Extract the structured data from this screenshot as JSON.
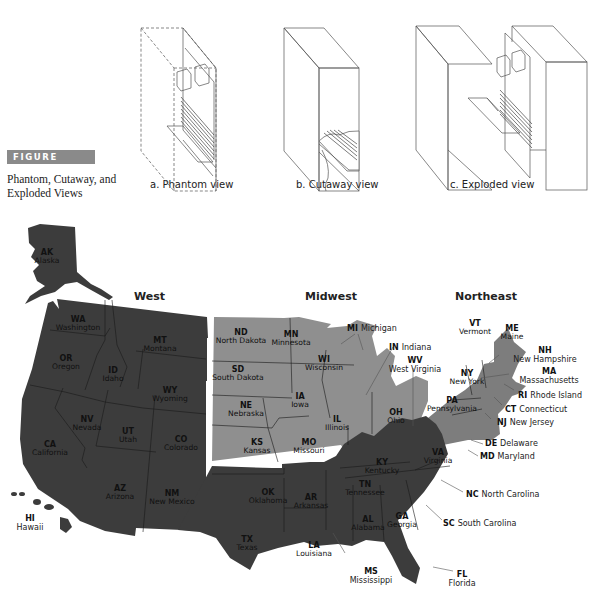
{
  "figure": {
    "badge": "FIGURE 12.40",
    "caption_line1": "Phantom, Cutaway, and",
    "caption_line2": "Exploded Views",
    "badge_color": "#8a8a8a"
  },
  "views": [
    {
      "label": "a. Phantom view"
    },
    {
      "label": "b. Cutaway view"
    },
    {
      "label": "c. Exploded view"
    }
  ],
  "map": {
    "colors": {
      "dark_regions": "#3c3c3c",
      "midwest": "#8f8f8f",
      "northeast": "#7d7d7d",
      "background": "#ffffff"
    },
    "regions": [
      {
        "name": "West"
      },
      {
        "name": "Midwest"
      },
      {
        "name": "Northeast"
      }
    ],
    "states_inside": [
      {
        "abbr": "AK",
        "name": "Alaska"
      },
      {
        "abbr": "WA",
        "name": "Washington"
      },
      {
        "abbr": "OR",
        "name": "Oregon"
      },
      {
        "abbr": "ID",
        "name": "Idaho"
      },
      {
        "abbr": "MT",
        "name": "Montana"
      },
      {
        "abbr": "WY",
        "name": "Wyoming"
      },
      {
        "abbr": "CA",
        "name": "California"
      },
      {
        "abbr": "NV",
        "name": "Nevada"
      },
      {
        "abbr": "UT",
        "name": "Utah"
      },
      {
        "abbr": "CO",
        "name": "Colorado"
      },
      {
        "abbr": "AZ",
        "name": "Arizona"
      },
      {
        "abbr": "NM",
        "name": "New Mexico"
      },
      {
        "abbr": "ND",
        "name": "North Dakota"
      },
      {
        "abbr": "MN",
        "name": "Minnesota"
      },
      {
        "abbr": "SD",
        "name": "South Dakota"
      },
      {
        "abbr": "WI",
        "name": "Wisconsin"
      },
      {
        "abbr": "NE",
        "name": "Nebraska"
      },
      {
        "abbr": "IA",
        "name": "Iowa"
      },
      {
        "abbr": "IL",
        "name": "Illinois"
      },
      {
        "abbr": "OH",
        "name": "Ohio"
      },
      {
        "abbr": "KS",
        "name": "Kansas"
      },
      {
        "abbr": "MO",
        "name": "Missouri"
      },
      {
        "abbr": "OK",
        "name": "Oklahoma"
      },
      {
        "abbr": "AR",
        "name": "Arkansas"
      },
      {
        "abbr": "TX",
        "name": "Texas"
      },
      {
        "abbr": "LA",
        "name": "Louisiana"
      },
      {
        "abbr": "KY",
        "name": "Kentucky"
      },
      {
        "abbr": "TN",
        "name": "Tennessee"
      },
      {
        "abbr": "AL",
        "name": "Alabama"
      },
      {
        "abbr": "GA",
        "name": "Georgia"
      },
      {
        "abbr": "VA",
        "name": "Virginia"
      },
      {
        "abbr": "NY",
        "name": "New York"
      },
      {
        "abbr": "PA",
        "name": "Pennsylvania"
      },
      {
        "abbr": "VT",
        "name": "Vermont"
      },
      {
        "abbr": "ME",
        "name": "Maine"
      }
    ],
    "states_callout": [
      {
        "abbr": "HI",
        "name": "Hawaii"
      },
      {
        "abbr": "MI",
        "name": "Michigan"
      },
      {
        "abbr": "IN",
        "name": "Indiana"
      },
      {
        "abbr": "WV",
        "name": "West Virginia"
      },
      {
        "abbr": "NH",
        "name": "New Hampshire"
      },
      {
        "abbr": "MA",
        "name": "Massachusetts"
      },
      {
        "abbr": "RI",
        "name": "Rhode Island"
      },
      {
        "abbr": "CT",
        "name": "Connecticut"
      },
      {
        "abbr": "NJ",
        "name": "New Jersey"
      },
      {
        "abbr": "DE",
        "name": "Delaware"
      },
      {
        "abbr": "MD",
        "name": "Maryland"
      },
      {
        "abbr": "NC",
        "name": "North Carolina"
      },
      {
        "abbr": "SC",
        "name": "South Carolina"
      },
      {
        "abbr": "MS",
        "name": "Mississippi"
      },
      {
        "abbr": "FL",
        "name": "Florida"
      }
    ]
  }
}
